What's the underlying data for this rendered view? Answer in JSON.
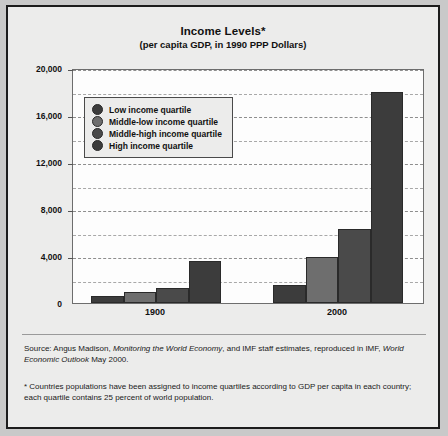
{
  "chart_data": {
    "type": "bar",
    "title": "Income Levels*",
    "subtitle": "(per capita GDP, in 1990 PPP Dollars)",
    "xlabel": "",
    "ylabel": "",
    "categories": [
      "1900",
      "2000"
    ],
    "ylim": [
      0,
      20000
    ],
    "y_major_ticks": [
      0,
      4000,
      8000,
      12000,
      16000,
      20000
    ],
    "y_major_tick_labels": [
      "0",
      "4,000",
      "8,000",
      "12,000",
      "16,000",
      "20,000"
    ],
    "y_minor_ticks": [
      2000,
      6000,
      10000,
      14000,
      18000
    ],
    "grid": "horizontal-dashed",
    "legend_position": "upper-left-inside",
    "series": [
      {
        "name": "Low income quartile",
        "color": "#3c3c3c",
        "values": [
          600,
          1500
        ]
      },
      {
        "name": "Middle-low income quartile",
        "color": "#6e6e6e",
        "values": [
          900,
          3900
        ]
      },
      {
        "name": "Middle-high income quartile",
        "color": "#4a4a4a",
        "values": [
          1300,
          6300
        ]
      },
      {
        "name": "High income quartile",
        "color": "#3c3c3c",
        "values": [
          3600,
          18000
        ]
      }
    ]
  },
  "notes": {
    "source_prefix": "Source: Angus Madison, ",
    "source_italic_1": "Monitoring the World Economy",
    "source_middle": ", and IMF staff estimates, reproduced in IMF, ",
    "source_italic_2": "World Economic Outlook",
    "source_suffix": " May 2000.",
    "footnote": "* Countries populations have been assigned to income quartiles according to GDP per capita in each country; each quartile contains 25 percent of world population."
  }
}
